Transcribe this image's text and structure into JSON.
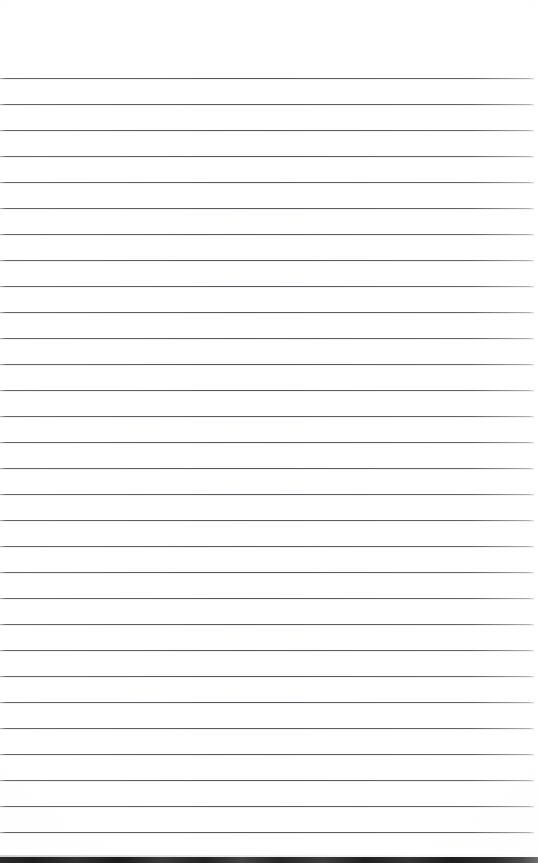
{
  "document": {
    "kind": "scanned-ruled-notepad-page",
    "title": "Blank Ruled Notepad Page",
    "page_width_px": 538,
    "page_height_px": 863,
    "paper_color": "#ffffff",
    "written_content": "",
    "visible_text": []
  },
  "top_margin": {
    "label": "top-margin",
    "height_px": 77,
    "has_content": false
  },
  "ruling": {
    "line_color": "#56565c",
    "line_thickness_px": 1,
    "first_line_y_px": 78,
    "line_spacing_px": 26,
    "line_count": 30,
    "line_start_x_px": 0,
    "line_end_x_px": 534,
    "line_y_positions": [
      78,
      104,
      130,
      156,
      182,
      208,
      234,
      260,
      286,
      312,
      338,
      364,
      390,
      416,
      442,
      468,
      494,
      520,
      546,
      572,
      598,
      624,
      650,
      676,
      702,
      728,
      754,
      780,
      806,
      832
    ]
  },
  "scan_edge": {
    "label": "scanner-bottom-edge",
    "color": "#242424",
    "top_y_px": 857,
    "height_px": 6,
    "spans_full_width": true
  }
}
